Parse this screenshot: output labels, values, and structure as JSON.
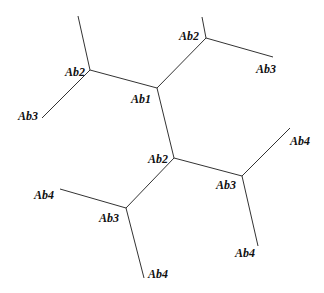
{
  "diagram": {
    "type": "tree",
    "nodes": [
      {
        "id": "n_ab1",
        "label": "Ab1",
        "x": 157,
        "y": 88,
        "lx": 131,
        "ly": 103
      },
      {
        "id": "n_ab2_left",
        "label": "Ab2",
        "x": 90,
        "y": 70,
        "lx": 66,
        "ly": 76
      },
      {
        "id": "n_ab2_top",
        "label": "Ab2",
        "x": 206,
        "y": 38,
        "lx": 179,
        "ly": 40
      },
      {
        "id": "n_ab2_mid",
        "label": "Ab2",
        "x": 174,
        "y": 158,
        "lx": 148,
        "ly": 163
      },
      {
        "id": "n_ab3_left",
        "label": "Ab3",
        "x": 126,
        "y": 208,
        "lx": 99,
        "ly": 222
      },
      {
        "id": "n_ab3_right",
        "label": "Ab3",
        "x": 242,
        "y": 176,
        "lx": 216,
        "ly": 189
      },
      {
        "id": "leaf_ab3_left",
        "label": "Ab3",
        "x": 42,
        "y": 118,
        "lx": 18,
        "ly": 120
      },
      {
        "id": "leaf_ab3_top",
        "label": "Ab3",
        "x": 273,
        "y": 57,
        "lx": 256,
        "ly": 73
      },
      {
        "id": "leaf_ab4_left",
        "label": "Ab4",
        "x": 60,
        "y": 189,
        "lx": 34,
        "ly": 199
      },
      {
        "id": "leaf_ab4_bottom_left",
        "label": "Ab4",
        "x": 144,
        "y": 278,
        "lx": 148,
        "ly": 278
      },
      {
        "id": "leaf_ab4_right",
        "label": "Ab4",
        "x": 290,
        "y": 128,
        "lx": 290,
        "ly": 145
      },
      {
        "id": "leaf_ab4_bottom_right",
        "label": "Ab4",
        "x": 258,
        "y": 246,
        "lx": 235,
        "ly": 257
      },
      {
        "id": "stub_left_up",
        "label": "",
        "x": 78,
        "y": 16
      },
      {
        "id": "stub_top_up",
        "label": "",
        "x": 202,
        "y": 17
      }
    ],
    "edges": [
      [
        "n_ab2_left",
        "stub_left_up"
      ],
      [
        "n_ab2_left",
        "leaf_ab3_left"
      ],
      [
        "n_ab2_left",
        "n_ab1"
      ],
      [
        "n_ab1",
        "n_ab2_top"
      ],
      [
        "n_ab2_top",
        "stub_top_up"
      ],
      [
        "n_ab2_top",
        "leaf_ab3_top"
      ],
      [
        "n_ab1",
        "n_ab2_mid"
      ],
      [
        "n_ab2_mid",
        "n_ab3_right"
      ],
      [
        "n_ab2_mid",
        "n_ab3_left"
      ],
      [
        "n_ab3_right",
        "leaf_ab4_right"
      ],
      [
        "n_ab3_right",
        "leaf_ab4_bottom_right"
      ],
      [
        "n_ab3_left",
        "leaf_ab4_left"
      ],
      [
        "n_ab3_left",
        "leaf_ab4_bottom_left"
      ]
    ]
  },
  "labels": {
    "ab1": "Ab1",
    "ab2_left": "Ab2",
    "ab2_top": "Ab2",
    "ab2_mid": "Ab2",
    "ab3_leaf_left": "Ab3",
    "ab3_leaf_top": "Ab3",
    "ab3_left": "Ab3",
    "ab3_right": "Ab3",
    "ab4_left": "Ab4",
    "ab4_bottom_left": "Ab4",
    "ab4_right": "Ab4",
    "ab4_bottom_right": "Ab4"
  },
  "colors": {
    "edge": "#333333",
    "text": "#111111",
    "background": "#ffffff"
  }
}
